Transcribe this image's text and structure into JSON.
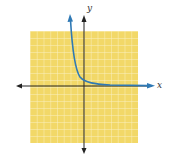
{
  "graph": {
    "x_axis_label": "x",
    "y_axis_label": "y",
    "grid": {
      "cells_x": 16,
      "cells_y": 16,
      "background_color": "#f2d868",
      "line_color": "#fbf0c0"
    },
    "axis_color": "#222222",
    "curve_color": "#2f79b5",
    "curve_description": "decreasing exponential, asymptotic to x-axis"
  }
}
